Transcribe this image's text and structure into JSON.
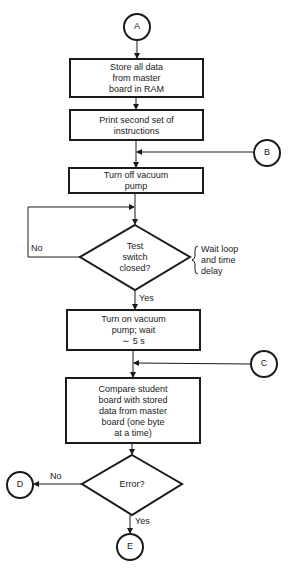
{
  "diagram": {
    "type": "flowchart",
    "connectors": {
      "A": "A",
      "B": "B",
      "C": "C",
      "D": "D",
      "E": "E"
    },
    "steps": {
      "store": [
        "Store all data",
        "from master",
        "board in RAM"
      ],
      "print": [
        "Print second set of",
        "instructions"
      ],
      "pump_off": [
        "Turn off vacuum",
        "pump"
      ],
      "test_switch": [
        "Test",
        "switch",
        "closed?"
      ],
      "pump_on": [
        "Turn on vacuum",
        "pump; wait",
        "∼ 5 s"
      ],
      "compare": [
        "Compare student",
        "board with stored",
        "data from master",
        "board (one byte",
        "at a time)"
      ],
      "error": [
        "Error?"
      ]
    },
    "branch_labels": {
      "test_no": "No",
      "test_yes": "Yes",
      "error_no": "No",
      "error_yes": "Yes"
    },
    "annotation": [
      "Wait loop",
      "and time",
      "delay"
    ],
    "colors": {
      "stroke": "#1a1a1a",
      "background": "#ffffff"
    }
  }
}
